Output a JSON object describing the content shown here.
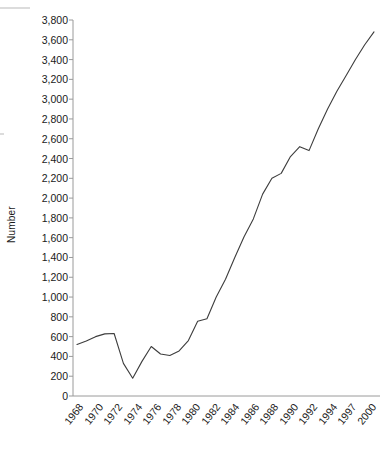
{
  "chart_data": {
    "type": "line",
    "title": "",
    "xlabel": "",
    "ylabel": "Number",
    "ylim": [
      0,
      3800
    ],
    "ytick_step": 200,
    "grid": false,
    "legend": null,
    "line_color": "#3d3d3d",
    "axis_color": "#9a9a9a",
    "categories": [
      "1968",
      "1969",
      "1970",
      "1971",
      "1972",
      "1973",
      "1974",
      "1975",
      "1976",
      "1977",
      "1978",
      "1979",
      "1980",
      "1981",
      "1982",
      "1983",
      "1984",
      "1985",
      "1986",
      "1987",
      "1988",
      "1989",
      "1990",
      "1991",
      "1992",
      "1993",
      "1994",
      "1995",
      "1996",
      "1997",
      "1998",
      "1999",
      "2000"
    ],
    "x_tick_labels": [
      "1968",
      "1970",
      "1972",
      "1974",
      "1976",
      "1978",
      "1980",
      "1982",
      "1984",
      "1986",
      "1988",
      "1990",
      "1992",
      "1994",
      "1997",
      "2000"
    ],
    "y_tick_labels": [
      "0",
      "200",
      "400",
      "600",
      "800",
      "1,000",
      "1,200",
      "1,400",
      "1,600",
      "1,800",
      "2,000",
      "2,200",
      "2,400",
      "2,600",
      "2,800",
      "3,000",
      "3,200",
      "3,400",
      "3,600",
      "3,800"
    ],
    "series": [
      {
        "name": "Number",
        "values": [
          520,
          555,
          600,
          628,
          632,
          330,
          180,
          350,
          500,
          425,
          410,
          455,
          560,
          755,
          780,
          1000,
          1180,
          1400,
          1610,
          1790,
          2040,
          2200,
          2250,
          2420,
          2520,
          2480,
          2700,
          2900,
          3080,
          3240,
          3400,
          3550,
          3680
        ]
      }
    ]
  }
}
